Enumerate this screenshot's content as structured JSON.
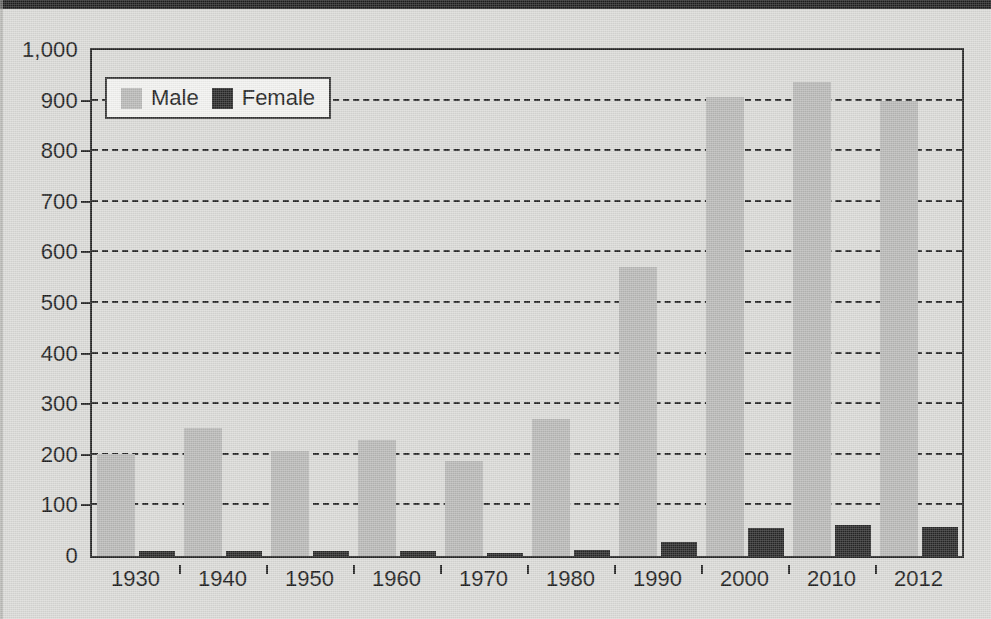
{
  "chart_data": {
    "type": "bar",
    "title": "",
    "xlabel": "",
    "ylabel": "",
    "ylim": [
      0,
      1000
    ],
    "ytick_step": 100,
    "ytick_labels": [
      "1,000",
      "900",
      "800",
      "700",
      "600",
      "500",
      "400",
      "300",
      "200",
      "100",
      "0"
    ],
    "ytick_values": [
      1000,
      900,
      800,
      700,
      600,
      500,
      400,
      300,
      200,
      100,
      0
    ],
    "grid": true,
    "grid_style": "dashed-horizontal",
    "legend_position": "top-left-inside",
    "categories": [
      "1930",
      "1940",
      "1950",
      "1960",
      "1970",
      "1980",
      "1990",
      "2000",
      "2010",
      "2012"
    ],
    "series": [
      {
        "name": "Male",
        "color": "#b6b6b4",
        "values": [
          202,
          253,
          208,
          229,
          188,
          271,
          572,
          907,
          936,
          899
        ]
      },
      {
        "name": "Female",
        "color": "#1d1d1d",
        "values": [
          10,
          10,
          9,
          9,
          5,
          12,
          28,
          55,
          62,
          58
        ]
      }
    ]
  },
  "legend": {
    "entries": [
      {
        "label": "Male",
        "swatch": "male-swatch"
      },
      {
        "label": "Female",
        "swatch": "female-swatch"
      }
    ]
  },
  "colors": {
    "background": "#d9d9d6",
    "axis": "#1a1a1a",
    "male_bar": "#b6b6b4",
    "female_bar": "#1d1d1d",
    "legend_background": "#f2f2f0"
  }
}
